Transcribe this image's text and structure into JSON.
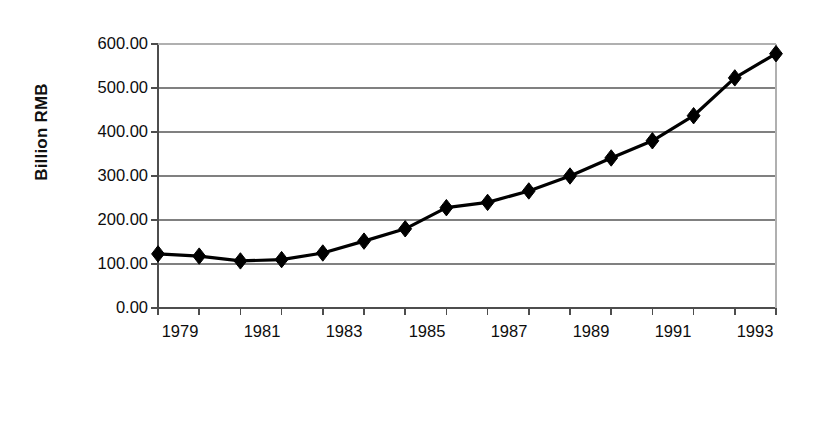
{
  "chart_data": {
    "type": "line",
    "title": "",
    "xlabel": "Year",
    "ylabel": "Billion RMB",
    "x": [
      1979,
      1980,
      1981,
      1982,
      1983,
      1984,
      1985,
      1986,
      1987,
      1988,
      1989,
      1990,
      1991,
      1992,
      1993,
      1994
    ],
    "values": [
      123,
      118,
      107,
      110,
      125,
      152,
      180,
      228,
      240,
      266,
      300,
      341,
      380,
      437,
      523,
      578
    ],
    "series": [
      {
        "name": "Billion RMB",
        "values": [
          123,
          118,
          107,
          110,
          125,
          152,
          180,
          228,
          240,
          266,
          300,
          341,
          380,
          437,
          523,
          578
        ]
      }
    ],
    "xlim": [
      1979,
      1994
    ],
    "ylim": [
      0,
      600
    ],
    "ytick_labels": [
      "600.00",
      "500.00",
      "400.00",
      "300.00",
      "200.00",
      "100.00",
      "0.00"
    ],
    "ytick_values": [
      600,
      500,
      400,
      300,
      200,
      100,
      0
    ],
    "xtick_values": [
      1979,
      1980,
      1981,
      1982,
      1983,
      1984,
      1985,
      1986,
      1987,
      1988,
      1989,
      1990,
      1991,
      1992,
      1993,
      1994
    ],
    "xtick_labels": [
      "1979",
      "",
      "1981",
      "",
      "1983",
      "",
      "1985",
      "",
      "1987",
      "",
      "1989",
      "",
      "1991",
      "",
      "1993",
      ""
    ],
    "grid": "horizontal",
    "legend": "none",
    "marker": "diamond",
    "line_color": "#000000",
    "marker_color": "#000000",
    "grid_color": "#808080",
    "axis_color": "#4d4d4d",
    "background": "#ffffff"
  }
}
